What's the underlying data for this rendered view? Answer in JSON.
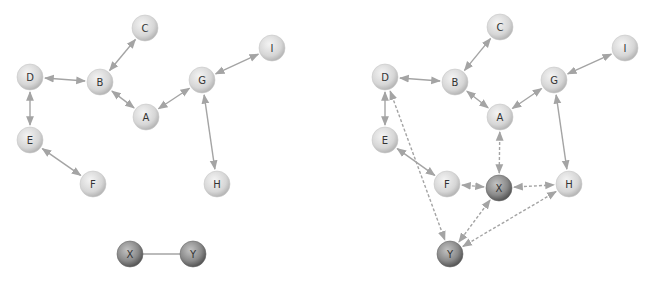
{
  "diagrams": [
    {
      "id": "left",
      "nodes": [
        {
          "label": "C",
          "x": 145,
          "y": 28,
          "dark": false
        },
        {
          "label": "I",
          "x": 272,
          "y": 48,
          "dark": false
        },
        {
          "label": "D",
          "x": 30,
          "y": 77,
          "dark": false
        },
        {
          "label": "B",
          "x": 100,
          "y": 82,
          "dark": false
        },
        {
          "label": "G",
          "x": 202,
          "y": 80,
          "dark": false
        },
        {
          "label": "A",
          "x": 146,
          "y": 117,
          "dark": false
        },
        {
          "label": "E",
          "x": 30,
          "y": 140,
          "dark": false
        },
        {
          "label": "F",
          "x": 93,
          "y": 184,
          "dark": false
        },
        {
          "label": "H",
          "x": 217,
          "y": 184,
          "dark": false
        },
        {
          "label": "X",
          "x": 130,
          "y": 254,
          "dark": true
        },
        {
          "label": "Y",
          "x": 193,
          "y": 254,
          "dark": true
        }
      ],
      "edges": [
        {
          "from": "B",
          "to": "C",
          "style": "solid",
          "arrows": "both"
        },
        {
          "from": "D",
          "to": "B",
          "style": "solid",
          "arrows": "both"
        },
        {
          "from": "B",
          "to": "A",
          "style": "solid",
          "arrows": "both"
        },
        {
          "from": "A",
          "to": "G",
          "style": "solid",
          "arrows": "both"
        },
        {
          "from": "G",
          "to": "I",
          "style": "solid",
          "arrows": "both"
        },
        {
          "from": "G",
          "to": "H",
          "style": "solid",
          "arrows": "both"
        },
        {
          "from": "D",
          "to": "E",
          "style": "solid",
          "arrows": "both"
        },
        {
          "from": "E",
          "to": "F",
          "style": "solid",
          "arrows": "both"
        },
        {
          "from": "X",
          "to": "Y",
          "style": "plain",
          "arrows": "none"
        }
      ]
    },
    {
      "id": "right",
      "nodes": [
        {
          "label": "C",
          "x": 500,
          "y": 27,
          "dark": false
        },
        {
          "label": "I",
          "x": 625,
          "y": 48,
          "dark": false
        },
        {
          "label": "D",
          "x": 385,
          "y": 77,
          "dark": false
        },
        {
          "label": "B",
          "x": 455,
          "y": 82,
          "dark": false
        },
        {
          "label": "G",
          "x": 554,
          "y": 80,
          "dark": false
        },
        {
          "label": "A",
          "x": 500,
          "y": 117,
          "dark": false
        },
        {
          "label": "E",
          "x": 385,
          "y": 140,
          "dark": false
        },
        {
          "label": "F",
          "x": 447,
          "y": 184,
          "dark": false
        },
        {
          "label": "X",
          "x": 499,
          "y": 188,
          "dark": true
        },
        {
          "label": "H",
          "x": 569,
          "y": 184,
          "dark": false
        },
        {
          "label": "Y",
          "x": 450,
          "y": 254,
          "dark": true
        }
      ],
      "edges": [
        {
          "from": "B",
          "to": "C",
          "style": "solid",
          "arrows": "both"
        },
        {
          "from": "D",
          "to": "B",
          "style": "solid",
          "arrows": "both"
        },
        {
          "from": "B",
          "to": "A",
          "style": "solid",
          "arrows": "both"
        },
        {
          "from": "A",
          "to": "G",
          "style": "solid",
          "arrows": "both"
        },
        {
          "from": "G",
          "to": "I",
          "style": "solid",
          "arrows": "both"
        },
        {
          "from": "G",
          "to": "H",
          "style": "solid",
          "arrows": "both"
        },
        {
          "from": "D",
          "to": "E",
          "style": "solid",
          "arrows": "both"
        },
        {
          "from": "E",
          "to": "F",
          "style": "solid",
          "arrows": "both"
        },
        {
          "from": "D",
          "to": "Y",
          "style": "dashed",
          "arrows": "both"
        },
        {
          "from": "A",
          "to": "X",
          "style": "dashed",
          "arrows": "both"
        },
        {
          "from": "F",
          "to": "X",
          "style": "dashed",
          "arrows": "both"
        },
        {
          "from": "X",
          "to": "H",
          "style": "dashed",
          "arrows": "both"
        },
        {
          "from": "X",
          "to": "Y",
          "style": "dashed",
          "arrows": "both"
        },
        {
          "from": "Y",
          "to": "H",
          "style": "dashed",
          "arrows": "both"
        }
      ]
    }
  ],
  "colors": {
    "edge": "#a4a4a4",
    "node_light_center": "#f2f2f2",
    "node_light_edge": "#bdbdbd",
    "node_dark_center": "#b8b8b8",
    "node_dark_edge": "#5e5e5e",
    "label": "#333333"
  },
  "node_radius": 13
}
